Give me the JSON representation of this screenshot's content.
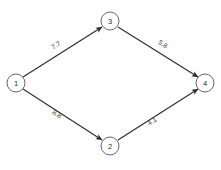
{
  "chart_data": {
    "type": "diagram",
    "title": "",
    "graph_kind": "directed-weighted-graph",
    "background_color": "#ffffff",
    "node_stroke_color": "#555555",
    "edge_color": "#2b2b2b",
    "nodes": [
      {
        "id": "1",
        "label": "1",
        "cx": 16,
        "cy": 83,
        "r": 9
      },
      {
        "id": "2",
        "label": "2",
        "cx": 110,
        "cy": 146,
        "r": 9
      },
      {
        "id": "3",
        "label": "3",
        "cx": 110,
        "cy": 21,
        "r": 9
      },
      {
        "id": "4",
        "label": "4",
        "cx": 205,
        "cy": 83,
        "r": 9
      }
    ],
    "edges": [
      {
        "from": "1",
        "to": "3",
        "weight": "7.7",
        "directed": true,
        "x1": 23,
        "y1": 77,
        "x2": 102,
        "y2": 27,
        "label_x": 56,
        "label_y": 45,
        "label_rotate": -32
      },
      {
        "from": "3",
        "to": "4",
        "weight": "5.8",
        "directed": true,
        "x1": 118,
        "y1": 27,
        "x2": 198,
        "y2": 77,
        "label_x": 163,
        "label_y": 44,
        "label_rotate": 32
      },
      {
        "from": "1",
        "to": "2",
        "weight": "8.8",
        "directed": true,
        "x1": 23,
        "y1": 89,
        "x2": 102,
        "y2": 140,
        "label_x": 57,
        "label_y": 114,
        "label_rotate": 32
      },
      {
        "from": "2",
        "to": "4",
        "weight": "4.1",
        "directed": true,
        "x1": 118,
        "y1": 140,
        "x2": 198,
        "y2": 89,
        "label_x": 152,
        "label_y": 121,
        "label_rotate": -32
      }
    ]
  }
}
